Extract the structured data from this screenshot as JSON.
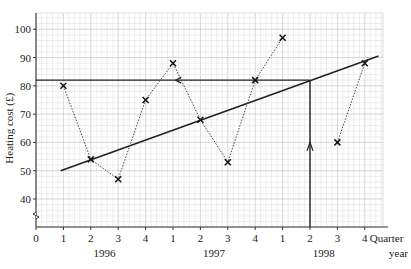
{
  "chart_data": {
    "type": "line",
    "title": "",
    "xlabel": "Quarter year",
    "ylabel": "Heating cost (£)",
    "x_tick_labels": [
      "0",
      "1",
      "2",
      "3",
      "4",
      "1",
      "2",
      "3",
      "4",
      "1",
      "2",
      "3",
      "4"
    ],
    "year_labels": [
      {
        "label": "1996",
        "center_index": 2.5
      },
      {
        "label": "1997",
        "center_index": 6.5
      },
      {
        "label": "1998",
        "center_index": 10.5
      }
    ],
    "y_ticks": [
      40,
      50,
      60,
      70,
      80,
      90,
      100
    ],
    "ylim": [
      30,
      105
    ],
    "xlim": [
      0,
      13
    ],
    "grid": true,
    "axis_break": true,
    "series": [
      {
        "name": "Heating cost",
        "style": "dotted with crosses",
        "points": [
          {
            "quarter": "1996 Q1",
            "x": 1,
            "y": 80
          },
          {
            "quarter": "1996 Q2",
            "x": 2,
            "y": 54
          },
          {
            "quarter": "1996 Q3",
            "x": 3,
            "y": 47
          },
          {
            "quarter": "1996 Q4",
            "x": 4,
            "y": 75
          },
          {
            "quarter": "1997 Q1",
            "x": 5,
            "y": 88
          },
          {
            "quarter": "1997 Q2",
            "x": 6,
            "y": 68
          },
          {
            "quarter": "1997 Q3",
            "x": 7,
            "y": 53
          },
          {
            "quarter": "1997 Q4",
            "x": 8,
            "y": 82
          },
          {
            "quarter": "1998 Q1",
            "x": 9,
            "y": 97
          },
          {
            "quarter": "1998 Q3",
            "x": 11,
            "y": 60
          },
          {
            "quarter": "1998 Q4",
            "x": 12,
            "y": 88
          }
        ],
        "segments": [
          [
            0,
            1,
            2,
            3,
            4,
            5,
            6,
            7,
            8
          ],
          [
            9,
            10
          ]
        ]
      }
    ],
    "trend_line": {
      "x1": 0.9,
      "y1": 50,
      "x2": 12.5,
      "y2": 90.5
    },
    "estimate": {
      "x": 10,
      "y": 82,
      "quarter": "1998 Q2"
    }
  }
}
